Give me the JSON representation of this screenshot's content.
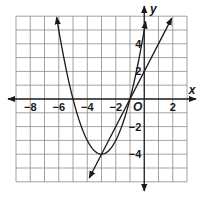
{
  "chart_data": {
    "type": "line",
    "title": "",
    "xlabel": "x",
    "ylabel": "y",
    "origin_label": "O",
    "xlim": [
      -9,
      3
    ],
    "ylim": [
      -6,
      6
    ],
    "grid": true,
    "grid_step": 1,
    "x_tick_labels": [
      "−8",
      "−6",
      "−4",
      "−2",
      "2"
    ],
    "x_tick_values": [
      -8,
      -6,
      -4,
      -2,
      2
    ],
    "y_tick_labels": [
      "4",
      "2",
      "−2",
      "−4"
    ],
    "y_tick_values": [
      4,
      2,
      -2,
      -4
    ],
    "series": [
      {
        "name": "parabola",
        "equation": "y = (x + 3)^2 - 4",
        "vertex": [
          -3,
          -4
        ],
        "x_intercepts": [
          -5,
          -1
        ],
        "x_range": [
          -6.15,
          0.1
        ],
        "arrows": "both ends"
      },
      {
        "name": "line",
        "equation": "y = 2x + 2",
        "points": [
          [
            -3,
            -4
          ],
          [
            -1,
            0
          ],
          [
            0,
            2
          ],
          [
            2,
            6
          ]
        ],
        "x_range": [
          -3.86,
          1.93
        ],
        "arrows": "both ends"
      }
    ],
    "intersections": [
      [
        -3,
        -4
      ],
      [
        -1,
        0
      ]
    ]
  }
}
